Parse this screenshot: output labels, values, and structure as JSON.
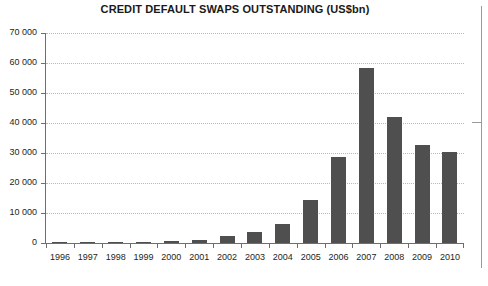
{
  "chart_data": {
    "type": "bar",
    "title": "CREDIT DEFAULT SWAPS OUTSTANDING (US$bn)",
    "xlabel": "",
    "ylabel": "",
    "categories": [
      "1996",
      "1997",
      "1998",
      "1999",
      "2000",
      "2001",
      "2002",
      "2003",
      "2004",
      "2005",
      "2006",
      "2007",
      "2008",
      "2009",
      "2010"
    ],
    "values": [
      40,
      90,
      180,
      300,
      630,
      920,
      2190,
      3780,
      6400,
      14300,
      28700,
      58200,
      41900,
      32700,
      30300
    ],
    "ylim": [
      0,
      70000
    ],
    "yticks": [
      0,
      10000,
      20000,
      30000,
      40000,
      50000,
      60000,
      70000
    ],
    "ytick_labels": [
      "0",
      "10 000",
      "20 000",
      "30 000",
      "40 000",
      "50 000",
      "60 000",
      "70 000"
    ],
    "grid": true,
    "legend": false,
    "bar_color": "#4f4f4f",
    "grid_color": "#b9b9b9",
    "axis_color": "#6e6e6e",
    "text_color": "#231f20",
    "background": "#ffffff"
  }
}
